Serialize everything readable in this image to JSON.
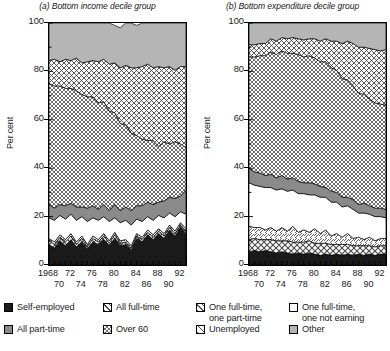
{
  "chart_data": [
    {
      "type": "area",
      "stacked": true,
      "title": "(a) Bottom income decile group",
      "xlabel": "",
      "ylabel": "Per cent",
      "ylim": [
        0,
        100
      ],
      "yticks": [
        0,
        20,
        40,
        60,
        80,
        100
      ],
      "xlim": [
        1968,
        1993
      ],
      "xticks": [
        1968,
        1969,
        1970,
        1971,
        1972,
        1973,
        1974,
        1975,
        1976,
        1977,
        1978,
        1979,
        1980,
        1981,
        1982,
        1983,
        1984,
        1985,
        1986,
        1987,
        1988,
        1989,
        1990,
        1991,
        1992,
        1993
      ],
      "xtick_labels_top": [
        "1968",
        "72",
        "76",
        "80",
        "84",
        "88",
        "92"
      ],
      "xtick_labels_bottom": [
        "70",
        "74",
        "78",
        "82",
        "86",
        "90"
      ],
      "grid": false,
      "legend_position": "bottom",
      "x": [
        1968,
        1969,
        1970,
        1971,
        1972,
        1973,
        1974,
        1975,
        1976,
        1977,
        1978,
        1979,
        1980,
        1981,
        1982,
        1983,
        1984,
        1985,
        1986,
        1987,
        1988,
        1989,
        1990,
        1991,
        1992,
        1993
      ],
      "series": [
        {
          "name": "Self-employed",
          "pattern": "solid-black",
          "values": [
            8.5,
            7.0,
            10.0,
            8.0,
            10.5,
            7.5,
            9.5,
            6.5,
            9.5,
            8.5,
            10.5,
            8.0,
            11.0,
            8.0,
            8.5,
            6.0,
            11.0,
            9.5,
            12.5,
            10.5,
            13.0,
            11.0,
            14.5,
            12.0,
            15.5,
            13.0
          ]
        },
        {
          "name": "All full-time",
          "pattern": "diagonal-cross",
          "values": [
            1.5,
            1.5,
            1.5,
            1.5,
            1.5,
            1.0,
            1.5,
            1.0,
            1.5,
            1.0,
            1.5,
            1.0,
            1.5,
            1.0,
            1.0,
            1.0,
            1.0,
            1.0,
            1.0,
            1.0,
            1.0,
            1.0,
            1.0,
            1.0,
            1.0,
            1.0
          ]
        },
        {
          "name": "One full-time, one part-time",
          "pattern": "diagonal-lines",
          "values": [
            1.0,
            1.0,
            1.0,
            1.0,
            1.0,
            1.0,
            1.0,
            1.0,
            1.0,
            1.0,
            1.0,
            1.0,
            1.0,
            1.0,
            1.0,
            1.0,
            1.0,
            1.0,
            1.0,
            1.0,
            1.0,
            1.0,
            1.0,
            1.0,
            1.0,
            1.0
          ]
        },
        {
          "name": "One full-time, one not earning",
          "pattern": "white",
          "values": [
            8.5,
            9.0,
            8.0,
            8.5,
            8.0,
            9.0,
            8.0,
            9.5,
            7.5,
            8.0,
            7.0,
            8.0,
            6.0,
            7.5,
            8.0,
            8.5,
            6.0,
            6.5,
            5.5,
            6.0,
            5.5,
            6.5,
            5.0,
            6.0,
            4.5,
            6.0
          ]
        },
        {
          "name": "All part-time",
          "pattern": "solid-gray",
          "values": [
            5.5,
            5.0,
            4.5,
            5.5,
            4.5,
            5.5,
            4.0,
            5.5,
            5.0,
            4.5,
            5.0,
            4.5,
            5.5,
            5.0,
            5.5,
            6.0,
            5.5,
            6.5,
            6.0,
            6.5,
            5.5,
            7.0,
            6.5,
            7.5,
            6.5,
            10.0
          ]
        },
        {
          "name": "Over 60",
          "pattern": "checker",
          "values": [
            50.0,
            50.5,
            49.0,
            48.5,
            47.5,
            48.0,
            46.5,
            46.0,
            45.0,
            44.0,
            42.5,
            41.0,
            38.0,
            36.0,
            34.0,
            32.0,
            29.0,
            27.5,
            25.5,
            26.5,
            23.0,
            24.5,
            22.0,
            23.5,
            21.5,
            17.5
          ]
        },
        {
          "name": "Unemployed",
          "pattern": "x-hatch",
          "values": [
            9.5,
            11.0,
            10.0,
            12.0,
            11.5,
            13.5,
            13.0,
            14.5,
            15.0,
            17.0,
            17.5,
            19.5,
            20.5,
            23.0,
            24.5,
            27.0,
            28.0,
            30.0,
            31.5,
            30.0,
            33.0,
            30.5,
            32.0,
            29.5,
            32.0,
            33.5
          ]
        },
        {
          "name": "Other",
          "pattern": "light-gray",
          "values": [
            15.5,
            15.0,
            16.0,
            15.0,
            15.5,
            14.5,
            16.5,
            16.0,
            15.5,
            16.0,
            15.0,
            17.0,
            15.5,
            16.5,
            17.5,
            18.5,
            17.5,
            18.0,
            17.0,
            18.5,
            18.0,
            18.5,
            18.0,
            19.5,
            18.0,
            18.0
          ]
        }
      ]
    },
    {
      "type": "area",
      "stacked": true,
      "title": "(b) Bottom expenditure decile group",
      "xlabel": "",
      "ylabel": "Per cent",
      "ylim": [
        0,
        100
      ],
      "yticks": [
        0,
        20,
        40,
        60,
        80,
        100
      ],
      "xlim": [
        1968,
        1993
      ],
      "xticks": [
        1968,
        1969,
        1970,
        1971,
        1972,
        1973,
        1974,
        1975,
        1976,
        1977,
        1978,
        1979,
        1980,
        1981,
        1982,
        1983,
        1984,
        1985,
        1986,
        1987,
        1988,
        1989,
        1990,
        1991,
        1992,
        1993
      ],
      "xtick_labels_top": [
        "1968",
        "72",
        "76",
        "80",
        "84",
        "88",
        "92"
      ],
      "xtick_labels_bottom": [
        "70",
        "74",
        "78",
        "82",
        "86",
        "90"
      ],
      "grid": false,
      "legend_position": "bottom",
      "x": [
        1968,
        1969,
        1970,
        1971,
        1972,
        1973,
        1974,
        1975,
        1976,
        1977,
        1978,
        1979,
        1980,
        1981,
        1982,
        1983,
        1984,
        1985,
        1986,
        1987,
        1988,
        1989,
        1990,
        1991,
        1992,
        1993
      ],
      "series": [
        {
          "name": "Self-employed",
          "pattern": "solid-black",
          "values": [
            5.5,
            6.0,
            5.5,
            6.0,
            5.5,
            5.0,
            5.5,
            5.0,
            4.5,
            5.0,
            4.5,
            5.0,
            4.5,
            4.0,
            4.5,
            4.0,
            4.5,
            4.0,
            4.5,
            4.0,
            4.5,
            4.0,
            4.5,
            4.0,
            4.5,
            4.5
          ]
        },
        {
          "name": "All full-time",
          "pattern": "diagonal-cross",
          "values": [
            5.0,
            5.0,
            5.0,
            4.5,
            5.0,
            5.0,
            4.5,
            5.0,
            5.0,
            4.5,
            5.0,
            5.0,
            4.5,
            5.0,
            4.5,
            4.5,
            4.0,
            4.5,
            4.0,
            4.0,
            3.5,
            4.0,
            3.5,
            3.5,
            3.5,
            3.5
          ]
        },
        {
          "name": "One full-time, one part-time",
          "pattern": "diagonal-lines",
          "values": [
            5.5,
            4.5,
            5.0,
            4.0,
            5.0,
            4.0,
            5.5,
            4.0,
            6.5,
            4.0,
            5.0,
            3.5,
            6.0,
            4.0,
            5.5,
            3.5,
            4.5,
            3.0,
            4.5,
            3.0,
            3.5,
            2.5,
            3.5,
            2.5,
            3.0,
            3.0
          ]
        },
        {
          "name": "One full-time, one not earning",
          "pattern": "white",
          "values": [
            18.0,
            17.5,
            17.0,
            17.5,
            16.5,
            17.0,
            16.0,
            16.5,
            15.0,
            16.0,
            15.0,
            15.5,
            14.0,
            15.0,
            13.5,
            14.0,
            13.0,
            12.5,
            11.5,
            12.0,
            10.0,
            11.0,
            9.5,
            10.0,
            9.0,
            8.5
          ]
        },
        {
          "name": "All part-time",
          "pattern": "solid-gray",
          "values": [
            6.0,
            5.5,
            5.5,
            5.0,
            5.5,
            5.0,
            5.5,
            5.0,
            5.0,
            5.0,
            4.5,
            5.0,
            4.5,
            4.5,
            4.0,
            4.5,
            4.0,
            4.0,
            3.5,
            4.0,
            3.5,
            4.0,
            3.5,
            3.5,
            3.5,
            3.5
          ]
        },
        {
          "name": "Over 60",
          "pattern": "checker",
          "values": [
            46.0,
            47.5,
            48.5,
            49.5,
            50.5,
            51.0,
            51.5,
            52.0,
            51.5,
            52.5,
            52.0,
            52.5,
            52.0,
            51.5,
            52.0,
            51.0,
            50.5,
            49.0,
            48.5,
            47.0,
            46.0,
            45.0,
            44.0,
            43.5,
            43.0,
            43.0
          ]
        },
        {
          "name": "Unemployed",
          "pattern": "x-hatch",
          "values": [
            5.0,
            5.0,
            5.0,
            5.0,
            5.5,
            5.5,
            5.5,
            6.0,
            6.5,
            6.5,
            7.0,
            7.0,
            8.0,
            8.5,
            9.5,
            11.0,
            12.0,
            14.5,
            16.0,
            17.5,
            19.0,
            19.5,
            21.0,
            22.0,
            22.0,
            23.0
          ]
        },
        {
          "name": "Other",
          "pattern": "light-gray",
          "values": [
            9.0,
            9.0,
            8.5,
            8.5,
            6.5,
            7.5,
            6.0,
            6.5,
            6.0,
            6.5,
            7.0,
            6.5,
            6.5,
            7.5,
            6.5,
            7.5,
            7.5,
            8.5,
            7.5,
            8.5,
            10.0,
            10.0,
            10.5,
            11.0,
            11.5,
            11.0
          ]
        }
      ]
    }
  ],
  "panels": {
    "a": {
      "title": "(a) Bottom income decile group",
      "ylabel": "Per cent",
      "yticks": [
        "100",
        "80",
        "60",
        "40",
        "20",
        "0"
      ],
      "xtop": [
        "1968",
        "72",
        "76",
        "80",
        "84",
        "88",
        "92"
      ],
      "xbottom": [
        "70",
        "74",
        "78",
        "82",
        "86",
        "90"
      ]
    },
    "b": {
      "title": "(b) Bottom expenditure decile group",
      "ylabel": "Per cent",
      "yticks": [
        "100",
        "80",
        "60",
        "40",
        "20",
        "0"
      ],
      "xtop": [
        "1968",
        "72",
        "76",
        "80",
        "84",
        "88",
        "92"
      ],
      "xbottom": [
        "70",
        "74",
        "78",
        "82",
        "86",
        "90"
      ]
    }
  },
  "legend": {
    "items": [
      {
        "label": "Self-employed",
        "pattern": "solid-black"
      },
      {
        "label": "All full-time",
        "pattern": "diagonal-cross"
      },
      {
        "label": "One full-time,\none part-time",
        "pattern": "diagonal-lines"
      },
      {
        "label": "One full-time,\none not earning",
        "pattern": "white"
      },
      {
        "label": "All part-time",
        "pattern": "solid-gray"
      },
      {
        "label": "Over 60",
        "pattern": "checker"
      },
      {
        "label": "Unemployed",
        "pattern": "x-hatch"
      },
      {
        "label": "Other",
        "pattern": "light-gray"
      }
    ]
  },
  "colors": {
    "black": "#1a1a1a",
    "solid_gray": "#8a8a8a",
    "light_gray": "#b5b5b5",
    "white": "#ffffff",
    "axis": "#000000"
  }
}
